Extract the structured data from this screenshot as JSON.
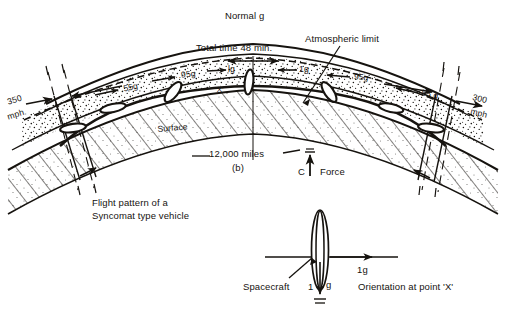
{
  "figure": {
    "panel_label": "(b)",
    "caption_line1": "Flight pattern of a",
    "caption_line2": "Syncomat type vehicle",
    "ink_color": "#16130f",
    "background_color": "#ffffff"
  },
  "upper_diagram": {
    "title_top": "Normal g",
    "total_time": "Total time 48 min.",
    "atmospheric_limit": "Atmospheric limit",
    "surface_label": "Surface",
    "distance_label": "12,000 miles",
    "point_label": "'X'",
    "force_label": "Force",
    "force_point": "C",
    "speed_left_line1": "350",
    "speed_left_line2": "mph.",
    "speed_right_line1": "300",
    "speed_right_line2": "mph",
    "g_markers": [
      {
        "id": "left-55g",
        "label": ".55g"
      },
      {
        "id": "left-95g",
        "label": ".95g"
      },
      {
        "id": "center-1g-left",
        "label": "lg"
      },
      {
        "id": "center-1g-right",
        "label": "1g"
      },
      {
        "id": "right-95g",
        "label": ".95g"
      },
      {
        "id": "right-55g",
        "label": ".55 g"
      }
    ]
  },
  "lower_diagram": {
    "spacecraft_label": "Spacecraft",
    "horizontal_g": "1g",
    "vertical_g_number": "1",
    "vertical_g_unit": "g",
    "orientation_caption": "Orientation at point 'X'"
  }
}
